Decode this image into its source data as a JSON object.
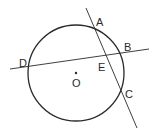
{
  "diagram": {
    "type": "geometry-circle-secants",
    "circle": {
      "center_label": "O",
      "cx": 76,
      "cy": 73,
      "r": 48
    },
    "points": {
      "A": {
        "label": "A",
        "x": 95,
        "y": 22
      },
      "B": {
        "label": "B",
        "x": 119,
        "y": 53
      },
      "C": {
        "label": "C",
        "x": 121,
        "y": 93
      },
      "D": {
        "label": "D",
        "x": 29,
        "y": 66
      },
      "E": {
        "label": "E",
        "x": 107,
        "y": 57
      }
    },
    "lines": [
      {
        "name": "AC",
        "through": [
          "A",
          "E",
          "C"
        ]
      },
      {
        "name": "DB",
        "through": [
          "D",
          "E",
          "B"
        ]
      }
    ],
    "colors": {
      "stroke": "#2a2a2a",
      "background": "#ffffff"
    }
  }
}
